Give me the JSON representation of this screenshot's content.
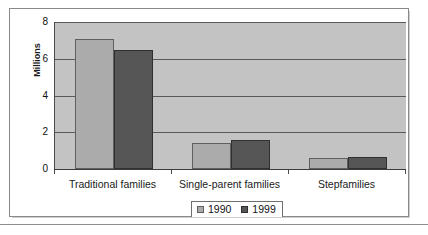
{
  "chart_data": {
    "type": "bar",
    "title": "",
    "subtitle": "",
    "xlabel": "",
    "ylabel": "Millions",
    "categories": [
      "Traditional families",
      "Single-parent families",
      "Stepfamilies"
    ],
    "series": [
      {
        "name": "1990",
        "values": [
          7.1,
          1.4,
          0.6
        ],
        "color": "#ababab"
      },
      {
        "name": "1999",
        "values": [
          6.45,
          1.6,
          0.65
        ],
        "color": "#565656"
      }
    ],
    "ylim": [
      0,
      8
    ],
    "yticks": [
      0,
      2,
      4,
      6,
      8
    ],
    "ytick_labels": [
      "0",
      "2",
      "4",
      "6",
      "8"
    ],
    "grid": true,
    "grid_axis": "y",
    "legend_position": "bottom",
    "legend_entries": [
      "1990",
      "1999"
    ],
    "plot_background": "#c3c3c3",
    "figure_background": "#ffffff"
  },
  "figure": {
    "frame_border_color": "#8a8a8a",
    "rule_color": "#8d8d8d"
  }
}
